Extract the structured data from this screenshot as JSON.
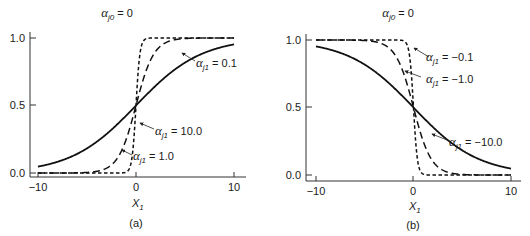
{
  "chart_data": [
    {
      "type": "line",
      "panel_label": "(a)",
      "title": "α_j0 = 0",
      "xlabel": "X_1",
      "ylabel": "",
      "xlim": [
        -10,
        10
      ],
      "ylim": [
        0,
        1
      ],
      "xticks": [
        "-10",
        "0",
        "10"
      ],
      "yticks": [
        "0.0",
        "0.5",
        "1.0"
      ],
      "grid": false,
      "series": [
        {
          "name": "α_j1 = 0.1",
          "style": "solid",
          "slope": 0.3,
          "annotation": "α_j1 = 0.1"
        },
        {
          "name": "α_j1 = 1.0",
          "style": "long-dash",
          "slope": 1.1,
          "annotation": "α_j1 = 1.0"
        },
        {
          "name": "α_j1 = 10.0",
          "style": "short-dash",
          "slope": 5.0,
          "annotation": "α_j1 = 10.0"
        }
      ],
      "x": [
        -10,
        -8,
        -6,
        -4,
        -2,
        0,
        2,
        4,
        6,
        8,
        10
      ],
      "values": {
        "α_j1 = 0.1": [
          0.05,
          0.08,
          0.14,
          0.23,
          0.35,
          0.5,
          0.65,
          0.77,
          0.86,
          0.92,
          0.95
        ],
        "α_j1 = 1.0": [
          0.0,
          0.0,
          0.0,
          0.01,
          0.1,
          0.5,
          0.9,
          0.99,
          1.0,
          1.0,
          1.0
        ],
        "α_j1 = 10.0": [
          0.0,
          0.0,
          0.0,
          0.0,
          0.0,
          0.5,
          1.0,
          1.0,
          1.0,
          1.0,
          1.0
        ]
      }
    },
    {
      "type": "line",
      "panel_label": "(b)",
      "title": "α_j0 = 0",
      "xlabel": "X_1",
      "ylabel": "",
      "xlim": [
        -10,
        10
      ],
      "ylim": [
        0,
        1
      ],
      "xticks": [
        "-10",
        "0",
        "10"
      ],
      "yticks": [
        "0.0",
        "0.5",
        "1.0"
      ],
      "grid": false,
      "series": [
        {
          "name": "α_j1 = -0.1",
          "style": "short-dash",
          "slope": -5.0,
          "annotation": "α_j1 = -0.1"
        },
        {
          "name": "α_j1 = -1.0",
          "style": "long-dash",
          "slope": -1.1,
          "annotation": "α_j1 = -1.0"
        },
        {
          "name": "α_j1 = -10.0",
          "style": "solid",
          "slope": -0.3,
          "annotation": "α_j1 = -10.0"
        }
      ],
      "x": [
        -10,
        -8,
        -6,
        -4,
        -2,
        0,
        2,
        4,
        6,
        8,
        10
      ],
      "values": {
        "α_j1 = -0.1": [
          1.0,
          1.0,
          1.0,
          1.0,
          1.0,
          0.5,
          0.0,
          0.0,
          0.0,
          0.0,
          0.0
        ],
        "α_j1 = -1.0": [
          1.0,
          1.0,
          1.0,
          0.99,
          0.9,
          0.5,
          0.1,
          0.01,
          0.0,
          0.0,
          0.0
        ],
        "α_j1 = -10.0": [
          0.95,
          0.92,
          0.86,
          0.77,
          0.65,
          0.5,
          0.35,
          0.23,
          0.14,
          0.08,
          0.05
        ]
      }
    }
  ],
  "panels": {
    "a": {
      "title_greek": "α",
      "title_sub": "j0",
      "title_rest": " = 0",
      "ytick_top": "1.0",
      "ytick_mid": "0.5",
      "ytick_bot": "0.0",
      "xtick_left": "−10",
      "xtick_mid": "0",
      "xtick_right": "10",
      "xlabel_main": "X",
      "xlabel_sub": "1",
      "label": "(a)",
      "ann1_greek": "α",
      "ann1_sub": "j1",
      "ann1_rest": " = 0.1",
      "ann2_greek": "α",
      "ann2_sub": "j1",
      "ann2_rest": " = 10.0",
      "ann3_greek": "α",
      "ann3_sub": "j1",
      "ann3_rest": " = 1.0"
    },
    "b": {
      "title_greek": "α",
      "title_sub": "j0",
      "title_rest": " = 0",
      "ytick_top": "1.0",
      "ytick_mid": "0.5",
      "ytick_bot": "0.0",
      "xtick_left": "−10",
      "xtick_mid": "0",
      "xtick_right": "10",
      "xlabel_main": "X",
      "xlabel_sub": "1",
      "label": "(b)",
      "ann1_greek": "α",
      "ann1_sub": "j1",
      "ann1_rest": " = −0.1",
      "ann2_greek": "α",
      "ann2_sub": "j1",
      "ann2_rest": " = −1.0",
      "ann3_greek": "α",
      "ann3_sub": "j1",
      "ann3_rest": " = −10.0"
    }
  }
}
